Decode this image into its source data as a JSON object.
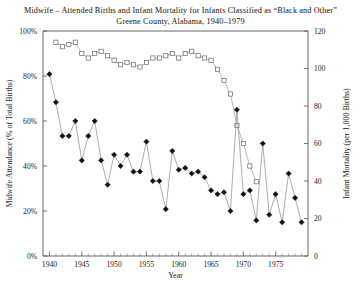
{
  "chart_data": {
    "type": "line",
    "title": "Midwife – Attended Births and Infant Mortality for Infants Classified as “Black and Other”",
    "subtitle": "Greene County, Alabama, 1940–1979",
    "xlabel": "Year",
    "ylabel": "Midwife Attendance (% of Total Births)",
    "y2label": "Infant Mortality (per 1,000 Births)",
    "xlim": [
      1939,
      1980
    ],
    "ylim": [
      0,
      100
    ],
    "y2lim": [
      0,
      120
    ],
    "grid": false,
    "legend": "none",
    "xticks": [
      1940,
      1945,
      1950,
      1955,
      1960,
      1965,
      1970,
      1975
    ],
    "xtick_labels": [
      "1940",
      "1945",
      "1950",
      "1955",
      "1960",
      "1965",
      "1970",
      "1975"
    ],
    "yticks": [
      0,
      20,
      40,
      60,
      80,
      100
    ],
    "ytick_labels": [
      "0%",
      "20%",
      "40%",
      "60%",
      "80%",
      "100%"
    ],
    "y2ticks": [
      0,
      20,
      40,
      60,
      80,
      100,
      120
    ],
    "y2tick_labels": [
      "0",
      "20",
      "40",
      "60",
      "80",
      "100",
      "120"
    ],
    "series": [
      {
        "name": "Midwife Attendance (% of Total Births)",
        "marker": "open-square",
        "axis": "left",
        "x": [
          1941,
          1942,
          1943,
          1944,
          1945,
          1946,
          1947,
          1948,
          1949,
          1950,
          1951,
          1952,
          1953,
          1954,
          1955,
          1956,
          1957,
          1958,
          1959,
          1960,
          1961,
          1962,
          1963,
          1964,
          1965,
          1966,
          1967,
          1968,
          1969,
          1970,
          1971,
          1972
        ],
        "values": [
          95,
          93,
          94,
          95,
          90,
          88,
          90,
          91,
          89,
          87,
          85,
          86,
          85,
          84,
          86,
          88,
          88,
          89,
          90,
          88,
          90,
          91,
          89,
          88,
          87,
          83,
          78,
          72,
          58,
          50,
          40,
          33
        ]
      },
      {
        "name": "Infant Mortality (per 1,000 Births)",
        "marker": "filled-diamond",
        "axis": "right",
        "x": [
          1940,
          1941,
          1942,
          1943,
          1944,
          1945,
          1946,
          1947,
          1948,
          1949,
          1950,
          1951,
          1952,
          1953,
          1954,
          1955,
          1956,
          1957,
          1958,
          1959,
          1960,
          1961,
          1962,
          1963,
          1964,
          1965,
          1966,
          1967,
          1968,
          1969,
          1970,
          1971,
          1972,
          1973,
          1974,
          1975,
          1976,
          1977,
          1978,
          1979
        ],
        "values": [
          97,
          82,
          64,
          64,
          72,
          51,
          64,
          72,
          51,
          38,
          54,
          48,
          54,
          45,
          45,
          61,
          40,
          40,
          25,
          56,
          46,
          47,
          44,
          45,
          42,
          35,
          33,
          34,
          24,
          78,
          33,
          35,
          19,
          60,
          22,
          33,
          18,
          44,
          31,
          18
        ]
      }
    ]
  }
}
